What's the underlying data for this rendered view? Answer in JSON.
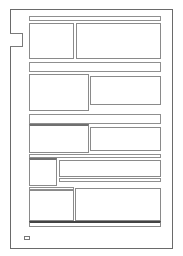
{
  "page": {
    "type": "wireframe-layout",
    "colors": {
      "stroke": "#8a8a8a",
      "frame": "#6a6a6a",
      "dark": "#444444",
      "background": "#ffffff"
    },
    "frame": {
      "x": 10,
      "y": 9,
      "w": 163,
      "h": 240
    },
    "side_tab": {
      "label": ""
    },
    "sections": [
      {
        "name": "row-1",
        "header_label": "",
        "blocks": [
          {
            "label": ""
          },
          {
            "label": ""
          }
        ]
      },
      {
        "name": "row-2",
        "header_label": "",
        "blocks": [
          {
            "label": ""
          },
          {
            "label": ""
          }
        ]
      },
      {
        "name": "row-3",
        "header_label": "",
        "blocks": [
          {
            "label": ""
          },
          {
            "label": ""
          }
        ]
      },
      {
        "name": "row-4",
        "header_label": "",
        "blocks": [
          {
            "label": ""
          },
          {
            "label": ""
          },
          {
            "label": ""
          }
        ]
      },
      {
        "name": "row-5",
        "header_label": "",
        "blocks": [
          {
            "label": ""
          },
          {
            "label": ""
          }
        ]
      }
    ],
    "footer_bar": {
      "label": ""
    },
    "footer_icon": {
      "label": ""
    }
  }
}
